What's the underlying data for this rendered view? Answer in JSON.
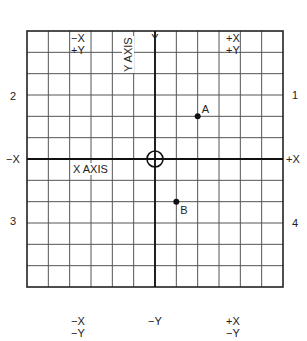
{
  "corner_labels": {
    "top_left": [
      "−X",
      "+Y"
    ],
    "top_center": [
      "Y"
    ],
    "top_right": [
      "+X",
      "+Y"
    ],
    "bottom_left": [
      "−X",
      "−Y"
    ],
    "bottom_center": [
      "−Y"
    ],
    "bottom_right": [
      "+X",
      "−Y"
    ]
  },
  "side_labels": {
    "left_upper": "2",
    "left_middle": "−X",
    "left_lower": "3",
    "right_upper": "1",
    "right_middle": "+X",
    "right_lower": "4"
  },
  "axis_labels": {
    "x_axis": "X AXIS",
    "y_axis": "Y AXIS"
  },
  "grid": {
    "columns": 12,
    "rows": 12,
    "left": 27,
    "top": 31,
    "size": 256
  },
  "points": [
    {
      "label": "A",
      "col": 2,
      "row": 2
    },
    {
      "label": "B",
      "col": 1,
      "row": -2
    }
  ],
  "origin_marker": "circle-crosshair"
}
